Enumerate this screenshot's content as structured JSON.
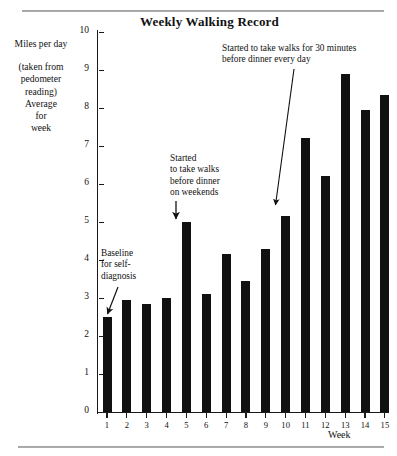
{
  "chart_data": {
    "type": "bar",
    "title": "Weekly Walking Record",
    "xlabel": "Week",
    "ylabel": "Miles per day",
    "ylabel_note": "(taken from pedometer reading) Average for week",
    "categories": [
      "1",
      "2",
      "3",
      "4",
      "5",
      "6",
      "7",
      "8",
      "9",
      "10",
      "11",
      "12",
      "13",
      "14",
      "15"
    ],
    "values": [
      2.5,
      2.95,
      2.85,
      3.0,
      5.0,
      3.1,
      4.15,
      3.45,
      4.3,
      5.15,
      7.2,
      6.2,
      8.9,
      7.95,
      8.35
    ],
    "ylim": [
      0,
      10
    ],
    "yticks": [
      0,
      1,
      2,
      3,
      4,
      5,
      6,
      7,
      8,
      9,
      10
    ],
    "ytick_labels": [
      "0",
      "1",
      "2",
      "3",
      "4",
      "5",
      "6",
      "7",
      "8",
      "9",
      "10"
    ],
    "grid": false,
    "legend": null,
    "bar_color": "#111111",
    "annotations": [
      {
        "id": "baseline",
        "text": "Baseline\nfor self-\ndiagnosis",
        "points_to_week": "1"
      },
      {
        "id": "weekends",
        "text": "Started\nto take walks\nbefore dinner\non weekends",
        "points_to_week": "5"
      },
      {
        "id": "every-day",
        "text": "Started to take walks for 30 minutes\nbefore dinner every day",
        "points_to_week": "10"
      }
    ]
  },
  "chart": {
    "title": "Weekly Walking Record",
    "y_axis": {
      "label_main": "Miles per day",
      "label_sub": "(taken from\npedometer\nreading)\nAverage\nfor\nweek",
      "ticks": [
        "0",
        "1",
        "2",
        "3",
        "4",
        "5",
        "6",
        "7",
        "8",
        "9",
        "10"
      ]
    },
    "x_axis": {
      "caption": "Week",
      "ticks": [
        "1",
        "2",
        "3",
        "4",
        "5",
        "6",
        "7",
        "8",
        "9",
        "10",
        "11",
        "12",
        "13",
        "14",
        "15"
      ]
    },
    "annotations": {
      "baseline": "Baseline\nfor self-\ndiagnosis",
      "weekends": "Started\nto take walks\nbefore dinner\non weekends",
      "every_day": "Started to take walks for 30 minutes\nbefore dinner every day"
    }
  }
}
